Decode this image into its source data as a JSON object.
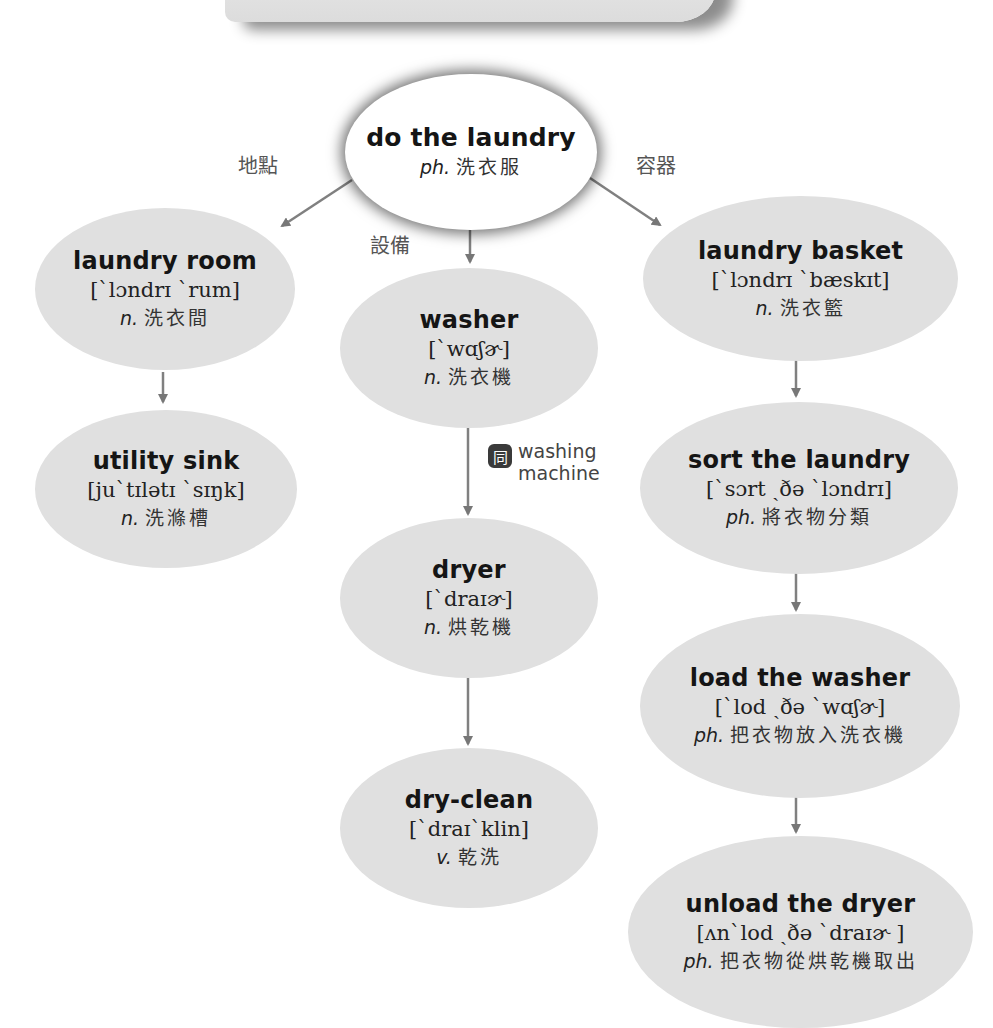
{
  "root": {
    "term": "do the laundry",
    "pos": "ph.",
    "meaning": "洗衣服"
  },
  "branch_labels": {
    "location": "地點",
    "equipment": "設備",
    "container": "容器"
  },
  "location_branch": [
    {
      "term": "laundry room",
      "ipa": "[`lɔndrɪ `rum]",
      "pos": "n.",
      "meaning": "洗衣間"
    },
    {
      "term": "utility sink",
      "ipa": "[ju`tɪlətɪ `sɪŋk]",
      "pos": "n.",
      "meaning": "洗滌槽"
    }
  ],
  "equipment_branch": [
    {
      "term": "washer",
      "ipa": "[`wɑʃɚ]",
      "pos": "n.",
      "meaning": "洗衣機"
    },
    {
      "term": "dryer",
      "ipa": "[`draɪɚ]",
      "pos": "n.",
      "meaning": "烘乾機"
    },
    {
      "term": "dry-clean",
      "ipa": "[`draɪ`klin]",
      "pos": "v.",
      "meaning": "乾洗"
    }
  ],
  "synonym": {
    "badge": "同",
    "line1": "washing",
    "line2": "machine"
  },
  "container_branch": [
    {
      "term": "laundry basket",
      "ipa": "[`lɔndrɪ `bæskɪt]",
      "pos": "n.",
      "meaning": "洗衣籃"
    },
    {
      "term": "sort the laundry",
      "ipa": "[`sɔrt ˏðə `lɔndrɪ]",
      "pos": "ph.",
      "meaning": "將衣物分類"
    },
    {
      "term": "load the washer",
      "ipa": "[`lod ˏðə `wɑʃɚ]",
      "pos": "ph.",
      "meaning": "把衣物放入洗衣機"
    },
    {
      "term": "unload the dryer",
      "ipa": "[ʌn`lod ˏðə `draɪɚ ]",
      "pos": "ph.",
      "meaning": "把衣物從烘乾機取出"
    }
  ],
  "colors": {
    "node_fill": "#e0e0e0",
    "arrow": "#777777",
    "root_fill": "#ffffff"
  }
}
